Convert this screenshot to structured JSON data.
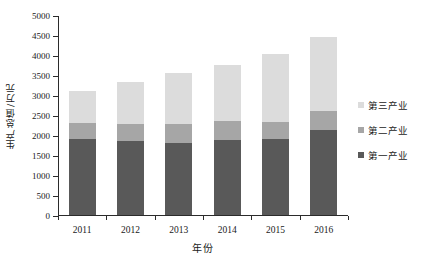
{
  "chart_data": {
    "type": "bar",
    "stacked": true,
    "title": "",
    "xlabel": "年份",
    "ylabel": "生产总值/万元",
    "categories": [
      "2011",
      "2012",
      "2013",
      "2014",
      "2015",
      "2016"
    ],
    "ylim": [
      0,
      5000
    ],
    "ytick_step": 500,
    "yticks": [
      "0",
      "500",
      "1000",
      "1500",
      "2000",
      "2500",
      "3000",
      "3500",
      "4000",
      "4500",
      "5000"
    ],
    "grid": false,
    "legend_position": "right",
    "series": [
      {
        "name": "第一产业",
        "color": "#595959",
        "values": [
          1900,
          1845,
          1810,
          1870,
          1895,
          2120
        ]
      },
      {
        "name": "第二产业",
        "color": "#a6a6a6",
        "values": [
          390,
          435,
          470,
          470,
          435,
          470
        ]
      },
      {
        "name": "第三产业",
        "color": "#dcdcdc",
        "values": [
          820,
          1050,
          1280,
          1410,
          1690,
          1870
        ]
      }
    ],
    "totals": [
      3110,
      3330,
      3560,
      3750,
      4020,
      4460
    ],
    "legend_order_displayed": [
      "第三产业",
      "第二产业",
      "第一产业"
    ]
  },
  "axis": {
    "y_title": "生产总值/万元",
    "x_title": "年份"
  }
}
